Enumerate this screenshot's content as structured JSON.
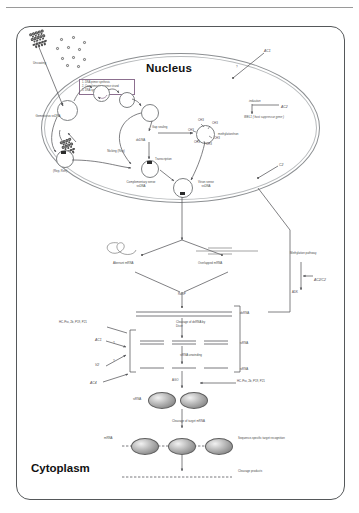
{
  "figure": {
    "compartments": {
      "nucleus": "Nucleus",
      "cytoplasm": "Cytoplasm"
    },
    "legend_box": {
      "items": [
        "1. DNA primer synthesis",
        "2. Complementary sense strand",
        "3. DNA synthesis"
      ]
    },
    "labels": {
      "uncoating": "Uncoating",
      "geminivirus_ssdna": "Geminivirus ssDNA",
      "gap_sealing": "Gap sealing",
      "dsdna": "dsDNA",
      "nicking_rep": "Nicking (Rep)",
      "rep_ren": "(Rep, Ren)",
      "complementary_sense_ssdna": "Complementary sense ssDNA",
      "virion_sense_ssdna": "Virion sense ssDNA",
      "transcription": "Transcription",
      "methylation_state": "methylation/non",
      "ch3": "CH3",
      "ac1": "AC1",
      "ac2": "AC2",
      "c2": "C2",
      "induction": "induction",
      "wel1": "WEL1 ( host suppressor gene )",
      "aberrant_mrna": "Aberrant mRNA",
      "overlapped_mrna": "Overlapped mRNA",
      "rdrp": "RdRP",
      "dsrna": "dsRNA",
      "cleavage_by_dicer": "Cleavage of dsRNA by Dicer",
      "sirna": "siRNA",
      "sirna_unwinding": "siRNA unwinding",
      "suppressors_left": "HC-Pro, 2b, P19, P21",
      "suppressors_right": "HC-Pro, 2b, P19, P21",
      "supp_ac1": "AC1",
      "supp_v2": "V2",
      "supp_ac4": "AC4",
      "question": "?",
      "ago": "AGO",
      "risc": "RISC",
      "cleavage_target_mrna": "Cleavage of target mRNA",
      "mrna": "mRNA",
      "sequence_specific": "Sequence-specific target recognition",
      "cleavage_products": "Cleavage products",
      "methylation_pathway": "Methylation pathway",
      "ac2_c2": "AC2/C2",
      "adk": "ADK"
    },
    "colors": {
      "cell_border": "#55585a",
      "nucleus_border": "#8d9093",
      "text": "#4a4a4a",
      "legend_border": "#8c6f8f",
      "arrow": "#55565a",
      "risc_fill": "#8a8a8a"
    }
  }
}
